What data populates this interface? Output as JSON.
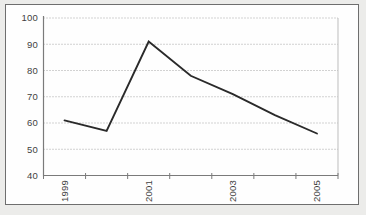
{
  "chart_data": {
    "type": "line",
    "x": [
      "1999",
      "2000",
      "2001",
      "2002",
      "2003",
      "2004",
      "2005"
    ],
    "series": [
      {
        "name": "series-1",
        "values": [
          61,
          57,
          91,
          78,
          71,
          63,
          56
        ]
      }
    ],
    "title": "",
    "xlabel": "",
    "ylabel": "",
    "ylim": [
      40,
      100
    ],
    "y_ticks": [
      40,
      50,
      60,
      70,
      80,
      90,
      100
    ],
    "x_label_indices": [
      0,
      2,
      4,
      6
    ],
    "x_labels_rotated_degrees": 90,
    "grid": "horizontal-dotted",
    "legend": "none",
    "colors": {
      "line": "#2a2a2a",
      "axis": "#7a7a7a",
      "gridline": "#a6a6a6",
      "plot_right_border": "#bdbdbd",
      "tick_label": "#3f3f3f",
      "chart_background": "#fefefe",
      "frame_border": "#6e6e6e",
      "page_background": "#ececea"
    }
  }
}
